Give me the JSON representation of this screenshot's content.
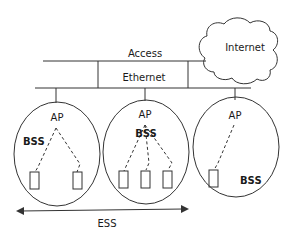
{
  "diagram": {
    "title_labels": {
      "access": "Access",
      "ethernet": "Ethernet",
      "internet": "Internet",
      "ess": "ESS"
    },
    "bss_cells": [
      {
        "ap_label": "AP",
        "bss_label": "BSS",
        "stations": 2
      },
      {
        "ap_label": "AP",
        "bss_label": "BSS",
        "stations": 3
      },
      {
        "ap_label": "AP",
        "bss_label": "BSS",
        "stations": 1
      }
    ],
    "colors": {
      "stroke": "#333333",
      "text": "#1a1a1a",
      "background": "#ffffff"
    }
  }
}
